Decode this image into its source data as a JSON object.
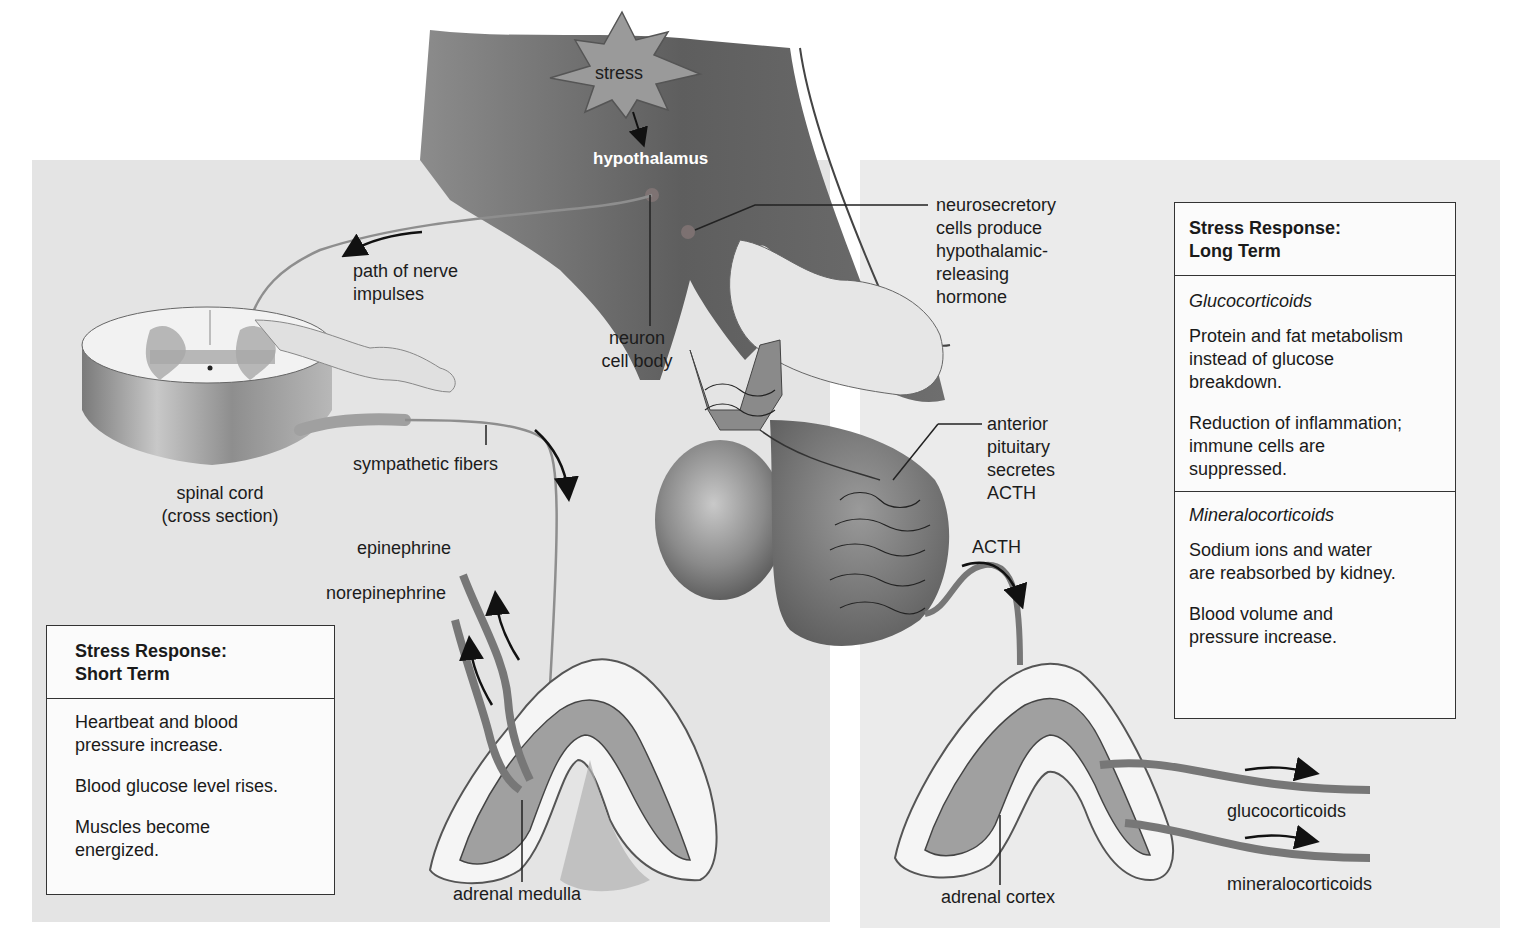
{
  "diagram": {
    "topic": "Stress response: hypothalamus, pituitary and adrenal glands",
    "labels": {
      "stress": "stress",
      "hypothalamus": "hypothalamus",
      "path_of_nerve_impulses": [
        "path of nerve",
        "impulses"
      ],
      "neurosecretory": [
        "neurosecretory",
        "cells produce",
        "hypothalamic-",
        "releasing",
        "hormone"
      ],
      "neuron_cell_body": [
        "neuron",
        "cell body"
      ],
      "spinal_cord": [
        "spinal cord",
        "(cross section)"
      ],
      "sympathetic_fibers": "sympathetic fibers",
      "anterior_pituitary": [
        "anterior",
        "pituitary",
        "secretes",
        "ACTH"
      ],
      "acth": "ACTH",
      "epinephrine": "epinephrine",
      "norepinephrine": "norepinephrine",
      "adrenal_medulla": "adrenal medulla",
      "adrenal_cortex": "adrenal cortex",
      "glucocorticoids": "glucocorticoids",
      "mineralocorticoids": "mineralocorticoids"
    },
    "short_term_box": {
      "title": [
        "Stress Response:",
        "Short Term"
      ],
      "items": [
        [
          "Heartbeat and blood",
          "pressure increase."
        ],
        [
          "Blood glucose level rises."
        ],
        [
          "Muscles become",
          "energized."
        ]
      ]
    },
    "long_term_box": {
      "title": [
        "Stress Response:",
        "Long Term"
      ],
      "sections": [
        {
          "heading": "Glucocorticoids",
          "items": [
            [
              "Protein and fat metabolism",
              "instead of glucose",
              "breakdown."
            ],
            [
              "Reduction of inflammation;",
              "immune cells are",
              "suppressed."
            ]
          ]
        },
        {
          "heading": "Mineralocorticoids",
          "items": [
            [
              "Sodium ions and water",
              "are reabsorbed by kidney."
            ],
            [
              "Blood volume and",
              "pressure increase."
            ]
          ]
        }
      ]
    },
    "colors": {
      "panel_gray": "#e4e4e4",
      "brain_dark": "#5a5a5a",
      "tissue_light": "#d8d8d8",
      "line": "#222222"
    }
  }
}
